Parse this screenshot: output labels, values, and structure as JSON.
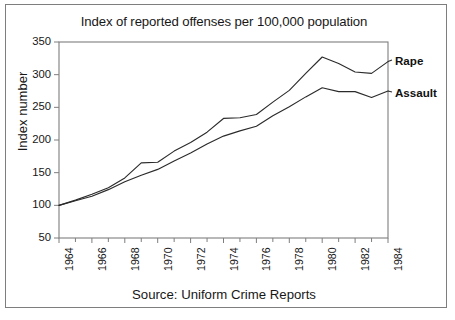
{
  "figure": {
    "title": "Index of reported offenses per 100,000 population",
    "source_caption": "Source: Uniform Crime Reports",
    "ylabel": "Index number",
    "frame_color": "#7e7e7e",
    "line_color": "#2b2b2b",
    "background": "#ffffff"
  },
  "chart_data": {
    "type": "line",
    "title": "Index of reported offenses per 100,000 population",
    "subtitle": "",
    "xlabel": "",
    "ylabel": "Index number",
    "caption": "Source: Uniform Crime Reports",
    "xlim": [
      1964,
      1984
    ],
    "ylim": [
      50,
      350
    ],
    "ytick_labels": [
      "350",
      "300",
      "250",
      "200",
      "150",
      "100",
      "50"
    ],
    "yticks": [
      350,
      300,
      250,
      200,
      150,
      100,
      50
    ],
    "xtick_labels": [
      "1964",
      "1966",
      "1968",
      "1970",
      "1972",
      "1974",
      "1976",
      "1978",
      "1980",
      "1982",
      "1984"
    ],
    "xticks_major": [
      1964,
      1966,
      1968,
      1970,
      1972,
      1974,
      1976,
      1978,
      1980,
      1982,
      1984
    ],
    "xticks_minor": [
      1965,
      1967,
      1969,
      1971,
      1973,
      1975,
      1977,
      1979,
      1981,
      1983
    ],
    "grid": false,
    "legend_position": "right-inline",
    "x": [
      1964,
      1965,
      1966,
      1967,
      1968,
      1969,
      1970,
      1971,
      1972,
      1973,
      1974,
      1975,
      1976,
      1977,
      1978,
      1979,
      1980,
      1981,
      1982,
      1983,
      1984
    ],
    "series": [
      {
        "name": "Rape",
        "label": "Rape",
        "values": [
          100,
          108,
          117,
          127,
          142,
          165,
          166,
          183,
          196,
          212,
          233,
          234,
          239,
          258,
          276,
          302,
          327,
          317,
          304,
          302,
          320
        ]
      },
      {
        "name": "Assault",
        "label": "Assault",
        "values": [
          100,
          107,
          114,
          124,
          136,
          146,
          155,
          168,
          180,
          194,
          206,
          214,
          221,
          237,
          251,
          266,
          280,
          274,
          274,
          265,
          275
        ]
      }
    ]
  },
  "axes_geometry": {
    "plot_left_px": 59,
    "plot_right_px": 388,
    "plot_top_px": 42,
    "plot_bottom_px": 238
  }
}
